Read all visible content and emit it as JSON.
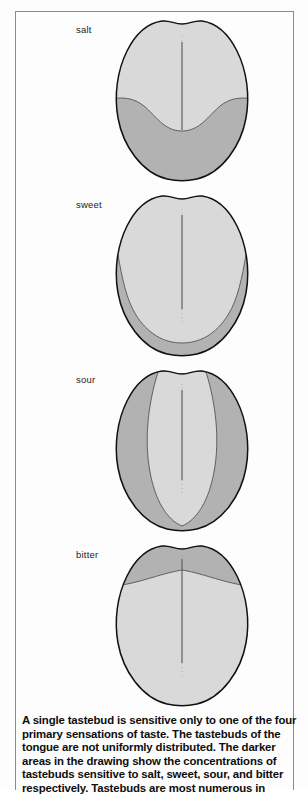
{
  "figure": {
    "title_label": "tongue-taste-regions-figure",
    "colors": {
      "light_shade": "#d9d9d9",
      "dark_shade": "#b2b2b2",
      "outline": "#111111",
      "frame": "#8b8b8b",
      "text": "#0d0d0d"
    },
    "panels": [
      {
        "label": "salt",
        "region_description": "darker shading across the lower sides and tip of the tongue",
        "dark_region": "lower-sides-and-tip"
      },
      {
        "label": "sweet",
        "region_description": "darker shading forming a narrow band around the outer rim of the lower two thirds",
        "dark_region": "outer-rim-lower"
      },
      {
        "label": "sour",
        "region_description": "darker shading down both lateral edges of the tongue",
        "dark_region": "lateral-edges"
      },
      {
        "label": "bitter",
        "region_description": "darker shading across the back (upper) portion of the tongue",
        "dark_region": "back-upper"
      }
    ]
  },
  "caption": {
    "lines": [
      "A single tastebud is sensitive only to one of the four",
      "primary sensations of taste. The tastebuds of the",
      "tongue are not uniformly distributed. The darker",
      "areas in the drawing show the concentrations of",
      "tastebuds sensitive to salt, sweet, sour, and bitter",
      "respectively. Tastebuds are most numerous in"
    ],
    "full_text": "A single tastebud is sensitive only to one of the four primary sensations of taste. The tastebuds of the tongue are not uniformly distributed. The darker areas in the drawing show the concentrations of tastebuds sensitive to salt, sweet, sour, and bitter respectively. Tastebuds are most numerous in"
  }
}
